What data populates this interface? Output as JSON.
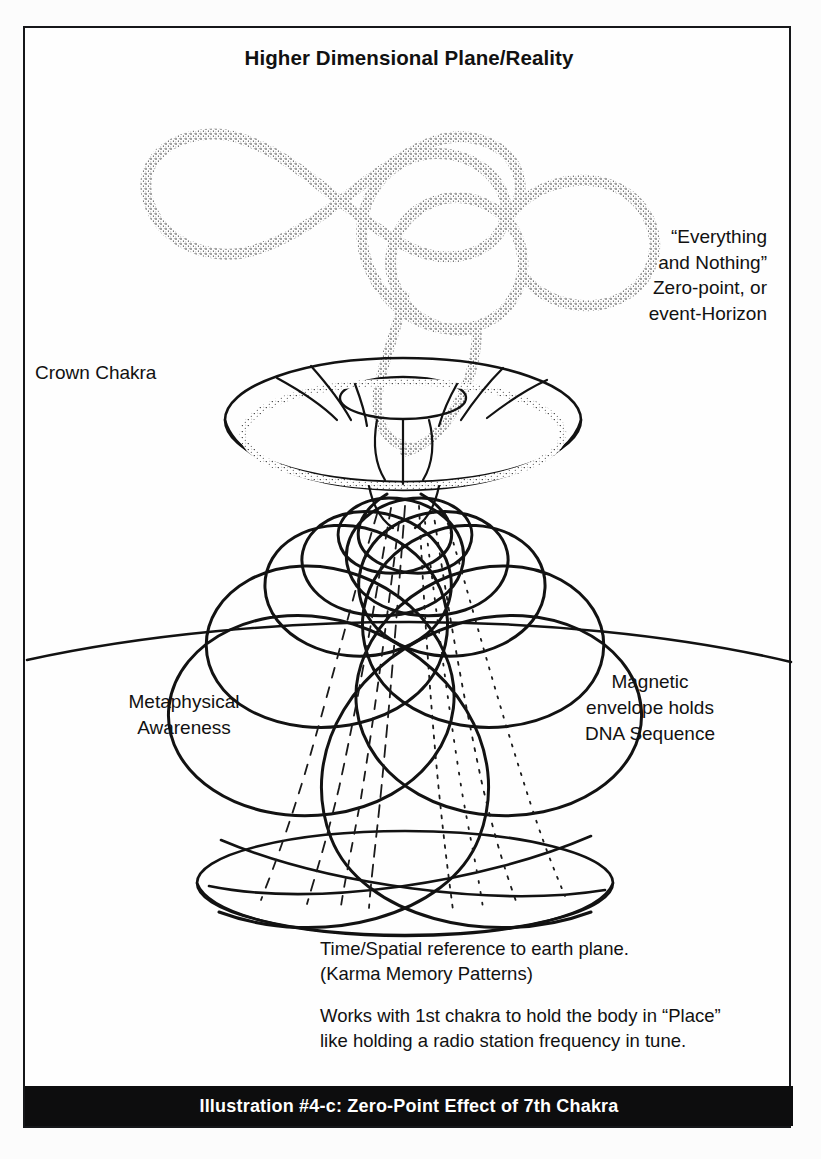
{
  "figure": {
    "title": "Higher Dimensional Plane/Reality",
    "caption": "Illustration #4-c: Zero-Point Effect of 7th Chakra",
    "ink_color": "#111111",
    "caption_bar_color": "#0d0d0e",
    "caption_text_color": "#ffffff",
    "background_color": "#fdfdfd"
  },
  "labels": {
    "crown_chakra": "Crown Chakra",
    "zero_point": {
      "line1": "“Everything",
      "line2": "and Nothing”",
      "line3": "Zero-point, or",
      "line4": "event-Horizon"
    },
    "metaphysical": {
      "line1": "Metaphysical",
      "line2": "Awareness"
    },
    "magnetic": {
      "line1": "Magnetic",
      "line2": "envelope holds",
      "line3": "DNA Sequence"
    }
  },
  "notes": {
    "paragraph1": {
      "line1": "Time/Spatial reference to earth plane.",
      "line2": "(Karma Memory Patterns)"
    },
    "paragraph2": {
      "line1": "Works with 1st chakra to hold the body in “Place”",
      "line2": "like holding a radio station frequency in tune."
    }
  },
  "diagram_elements": {
    "lemniscate": "infinity-symbol-stippled",
    "torus": "crown-chakra-disk",
    "helix": "double-helix-cone",
    "horizon": "earth-plane-horizon-line",
    "base": "base-ellipse"
  }
}
